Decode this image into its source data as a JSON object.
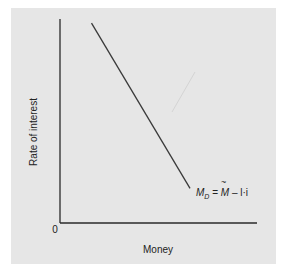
{
  "chart_data": {
    "type": "line",
    "title": "",
    "xlabel": "Money",
    "ylabel": "Rate of interest",
    "origin_label": "0",
    "xlim": [
      0,
      10
    ],
    "ylim": [
      0,
      10
    ],
    "grid": false,
    "x_ticks": [],
    "y_ticks": [],
    "series": [
      {
        "name": "Money demand",
        "label_parts": {
          "main": "M",
          "sub": "D",
          "eq": " = ",
          "tilde": "M",
          "rest": " – l·i"
        },
        "points": [
          [
            1.6,
            9.8
          ],
          [
            6.6,
            1.7
          ]
        ]
      }
    ],
    "annotations": [
      {
        "text": "M_D = M̃ – l·i",
        "attached_to": "end of line"
      }
    ]
  },
  "colors": {
    "panel": "#e6e6e6",
    "axis": "#2a2a2a",
    "line": "#3a3a3a"
  }
}
